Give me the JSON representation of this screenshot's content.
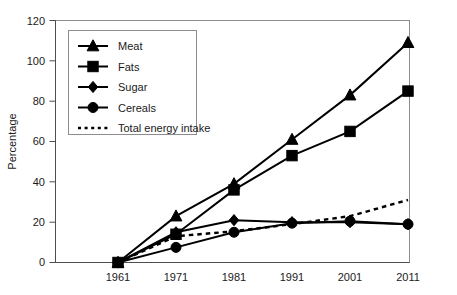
{
  "chart_data": {
    "type": "line",
    "title": "",
    "xlabel": "",
    "ylabel": "Percentage",
    "x": [
      1961,
      1971,
      1981,
      1991,
      2001,
      2011
    ],
    "xtick_labels": [
      "1961",
      "1971",
      "1981",
      "1991",
      "2001",
      "2011"
    ],
    "ytick_labels": [
      "0",
      "20",
      "40",
      "60",
      "80",
      "100",
      "120"
    ],
    "ytick_values": [
      0,
      20,
      40,
      60,
      80,
      100,
      120
    ],
    "ylim": [
      0,
      120
    ],
    "xlim": [
      1961,
      2011
    ],
    "grid": false,
    "legend_position": "upper-left-inside",
    "series": [
      {
        "name": "Meat",
        "marker": "triangle",
        "linestyle": "solid",
        "color": "#000000",
        "values": [
          0,
          23,
          39,
          61,
          83,
          109
        ]
      },
      {
        "name": "Fats",
        "marker": "square",
        "linestyle": "solid",
        "color": "#000000",
        "values": [
          0,
          14,
          36,
          53,
          65,
          85
        ]
      },
      {
        "name": "Sugar",
        "marker": "diamond",
        "linestyle": "solid",
        "color": "#000000",
        "values": [
          0,
          15,
          21,
          20,
          20,
          19
        ]
      },
      {
        "name": "Cereals",
        "marker": "circle",
        "linestyle": "solid",
        "color": "#000000",
        "values": [
          0,
          7.5,
          15,
          19.5,
          20.5,
          19
        ]
      },
      {
        "name": "Total energy intake",
        "marker": "none",
        "linestyle": "dotted",
        "color": "#000000",
        "values": [
          0,
          13,
          15.5,
          19,
          23,
          31
        ]
      }
    ]
  },
  "legend": {
    "items": [
      {
        "label": "Meat",
        "marker": "triangle",
        "linestyle": "solid"
      },
      {
        "label": "Fats",
        "marker": "square",
        "linestyle": "solid"
      },
      {
        "label": "Sugar",
        "marker": "diamond",
        "linestyle": "solid"
      },
      {
        "label": "Cereals",
        "marker": "circle",
        "linestyle": "solid"
      },
      {
        "label": "Total energy intake",
        "marker": "none",
        "linestyle": "dotted"
      }
    ]
  },
  "colors": {
    "ink": "#000000",
    "frame": "#8c8c8c",
    "axis": "#4d4d4d",
    "background": "#ffffff"
  }
}
